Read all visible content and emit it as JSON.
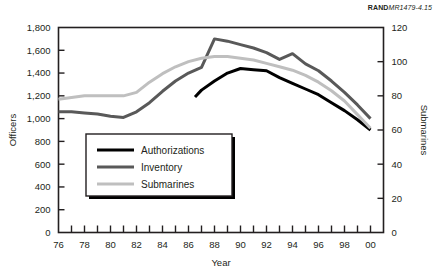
{
  "credit": {
    "brand": "RAND",
    "number": "MR1479-4.15"
  },
  "chart_data": {
    "type": "line",
    "title": "",
    "xlabel": "Year",
    "ylabel": "Officers",
    "y2label": "Submarines",
    "xlim": [
      76,
      101
    ],
    "ylim": [
      0,
      1800
    ],
    "y2lim": [
      0,
      120
    ],
    "grid": false,
    "legend_position": "center-left-inside",
    "xticks": [
      76,
      77,
      78,
      79,
      80,
      81,
      82,
      83,
      84,
      85,
      86,
      87,
      88,
      89,
      90,
      91,
      92,
      93,
      94,
      95,
      96,
      97,
      98,
      99,
      100,
      101
    ],
    "xticklabels": [
      "76",
      "",
      "78",
      "",
      "80",
      "",
      "82",
      "",
      "84",
      "",
      "86",
      "",
      "88",
      "",
      "90",
      "",
      "92",
      "",
      "94",
      "",
      "96",
      "",
      "98",
      "",
      "00",
      ""
    ],
    "yticks": [
      0,
      200,
      400,
      600,
      800,
      1000,
      1200,
      1400,
      1600,
      1800
    ],
    "yticklabels": [
      "0",
      "200",
      "400",
      "600",
      "800",
      "1,000",
      "1,200",
      "1,400",
      "1,600",
      "1,800"
    ],
    "y2ticks": [
      0,
      20,
      40,
      60,
      80,
      100,
      120
    ],
    "y2ticklabels": [
      "0",
      "20",
      "40",
      "60",
      "80",
      "100",
      "120"
    ],
    "series": [
      {
        "name": "Authorizations",
        "color": "#000000",
        "axis": "left",
        "width": 3.0,
        "x": [
          86.5,
          87,
          88,
          89,
          90,
          91,
          92,
          93,
          94,
          95,
          96,
          97,
          98,
          99,
          100
        ],
        "values": [
          1190,
          1250,
          1330,
          1400,
          1440,
          1430,
          1420,
          1360,
          1310,
          1260,
          1210,
          1140,
          1070,
          990,
          900
        ]
      },
      {
        "name": "Inventory",
        "color": "#595959",
        "axis": "left",
        "width": 3.0,
        "x": [
          76,
          77,
          78,
          79,
          80,
          81,
          82,
          83,
          84,
          85,
          86,
          87,
          88,
          89,
          90,
          91,
          92,
          93,
          94,
          95,
          96,
          97,
          98,
          99,
          100
        ],
        "values": [
          1060,
          1060,
          1050,
          1040,
          1020,
          1010,
          1060,
          1140,
          1240,
          1330,
          1400,
          1450,
          1700,
          1680,
          1650,
          1620,
          1580,
          1520,
          1570,
          1480,
          1420,
          1330,
          1230,
          1120,
          1000
        ]
      },
      {
        "name": "Submarines",
        "color": "#bfbfbf",
        "axis": "right",
        "width": 3.0,
        "x": [
          76,
          77,
          78,
          79,
          80,
          81,
          82,
          83,
          84,
          85,
          86,
          87,
          88,
          89,
          90,
          91,
          92,
          93,
          94,
          95,
          96,
          97,
          98,
          99,
          100
        ],
        "values": [
          78,
          79,
          80,
          80,
          80,
          80,
          82,
          88,
          93,
          97,
          100,
          102,
          103,
          103,
          102,
          101,
          99,
          97,
          95,
          92,
          88,
          83,
          77,
          69,
          61
        ]
      }
    ]
  }
}
